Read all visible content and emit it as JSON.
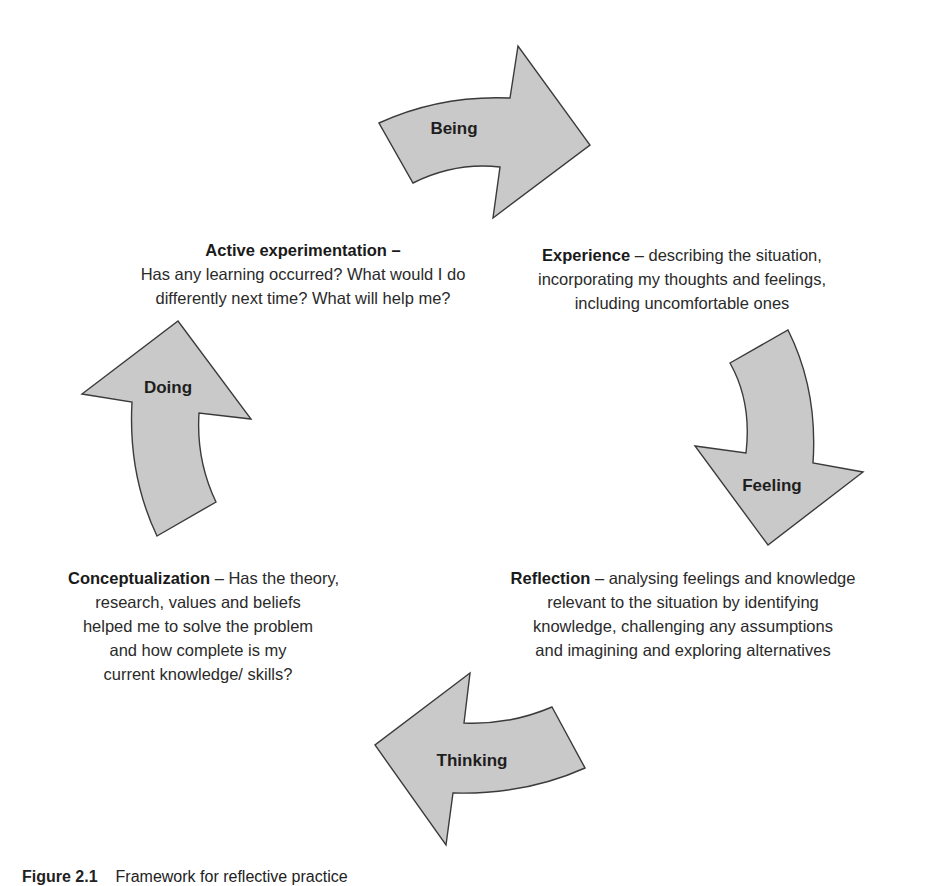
{
  "diagram": {
    "type": "cycle",
    "arrows": [
      {
        "id": "being",
        "label": "Being"
      },
      {
        "id": "feeling",
        "label": "Feeling"
      },
      {
        "id": "thinking",
        "label": "Thinking"
      },
      {
        "id": "doing",
        "label": "Doing"
      }
    ],
    "stages": {
      "experience": {
        "lead": "Experience",
        "line1_rest": " – describing the situation,",
        "lines": [
          "incorporating my thoughts and feelings,",
          "including uncomfortable ones"
        ]
      },
      "reflection": {
        "lead": "Reflection",
        "line1_rest": " – analysing feelings and knowledge",
        "lines": [
          "relevant to the situation by identifying",
          "knowledge, challenging any assumptions",
          "and imagining and exploring alternatives"
        ]
      },
      "conceptualization": {
        "lead": "Conceptualization",
        "line1_rest": " – Has the theory,",
        "lines": [
          "research, values and beliefs",
          "helped me to solve the problem",
          "and how complete is my",
          "current knowledge/ skills?"
        ]
      },
      "active_experimentation": {
        "lead": "Active experimentation –",
        "lines": [
          "Has any learning occurred? What would I do",
          "differently next time? What will help me?"
        ]
      }
    },
    "colors": {
      "arrow_fill": "#c9c9c9",
      "arrow_stroke": "#3a3a3a",
      "text": "#222222"
    }
  },
  "caption": {
    "number": "Figure 2.1",
    "text": "Framework for reflective practice"
  }
}
